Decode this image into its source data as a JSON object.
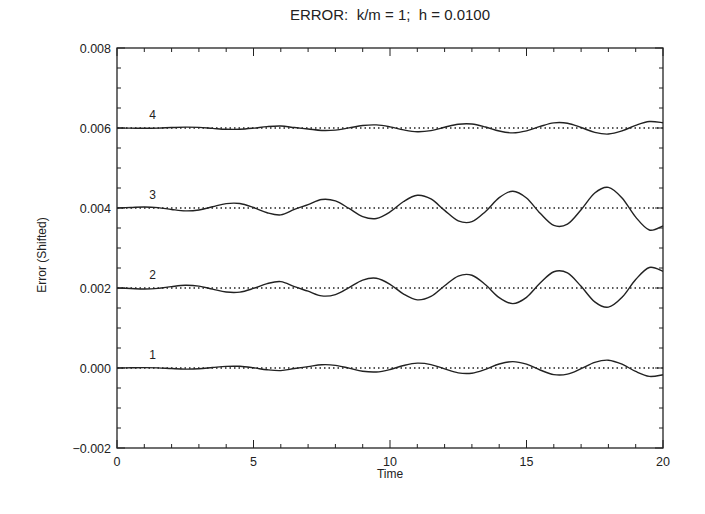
{
  "chart_data": {
    "type": "line",
    "title": "ERROR:  k/m = 1;  h = 0.0100",
    "xlabel": "Time",
    "ylabel": "Error (Shifted)",
    "xlim": [
      0,
      20
    ],
    "ylim": [
      -0.002,
      0.008
    ],
    "x_ticks": [
      0,
      5,
      10,
      15,
      20
    ],
    "x_tick_labels": [
      "0",
      "5",
      "10",
      "15",
      "20"
    ],
    "x_minor_step": 1,
    "y_ticks": [
      -0.002,
      0.0,
      0.002,
      0.004,
      0.006,
      0.008
    ],
    "y_tick_labels": [
      "-0.002",
      "0.000",
      "0.002",
      "0.004",
      "0.006",
      "0.008"
    ],
    "y_minor_step": 0.0005,
    "grid": false,
    "legend": "inline numeric labels at left of each curve",
    "x": [
      0,
      0.5,
      1,
      1.5,
      2,
      2.5,
      3,
      3.5,
      4,
      4.5,
      5,
      5.5,
      6,
      6.5,
      7,
      7.5,
      8,
      8.5,
      9,
      9.5,
      10,
      10.5,
      11,
      11.5,
      12,
      12.5,
      13,
      13.5,
      14,
      14.5,
      15,
      15.5,
      16,
      16.5,
      17,
      17.5,
      18,
      18.5,
      19,
      19.5,
      20
    ],
    "series": [
      {
        "name": "1",
        "label": "1",
        "baseline": 0.0,
        "label_x": 1.3,
        "values": [
          0.0,
          5e-06,
          1e-05,
          3e-06,
          -1.4e-05,
          -2.7e-05,
          -1.9e-05,
          1.2e-05,
          4.1e-05,
          4.2e-05,
          5e-06,
          -4.5e-05,
          -6.5e-05,
          -1.4e-05,
          3.3e-05,
          8.1e-05,
          6.7e-05,
          -4e-06,
          -8.1e-05,
          -9.9e-05,
          -3.8e-05,
          6.2e-05,
          0.000121,
          8.6e-05,
          -2.3e-05,
          -0.000122,
          -0.00013,
          -3.3e-05,
          9.9e-05,
          0.000159,
          9.5e-05,
          -5e-05,
          -0.000165,
          -0.000154,
          -1.7e-05,
          0.000141,
          0.000195,
          9.5e-05,
          -8.7e-05,
          -0.000209,
          -0.00017
        ]
      },
      {
        "name": "2",
        "label": "2",
        "baseline": 0.002,
        "label_x": 1.3,
        "values": [
          0.002,
          0.001988,
          0.001976,
          0.001991,
          0.002035,
          0.002067,
          0.002046,
          0.001971,
          0.001899,
          0.001897,
          0.001989,
          0.00211,
          0.002159,
          0.002034,
          0.00192,
          0.001802,
          0.001835,
          0.00201,
          0.002199,
          0.002244,
          0.002093,
          0.001848,
          0.001704,
          0.00179,
          0.002056,
          0.002299,
          0.002318,
          0.00208,
          0.001758,
          0.001609,
          0.001767,
          0.002124,
          0.002406,
          0.002377,
          0.002042,
          0.001653,
          0.001521,
          0.001767,
          0.002213,
          0.002513,
          0.002416
        ]
      },
      {
        "name": "3",
        "label": "3",
        "baseline": 0.004,
        "label_x": 1.3,
        "values": [
          0.004,
          0.004013,
          0.004026,
          0.004009,
          0.003963,
          0.003928,
          0.00395,
          0.004031,
          0.004109,
          0.004111,
          0.004012,
          0.003882,
          0.003829,
          0.003964,
          0.004086,
          0.004213,
          0.004177,
          0.003989,
          0.003786,
          0.003738,
          0.003901,
          0.004163,
          0.004318,
          0.004226,
          0.00394,
          0.003679,
          0.003658,
          0.003914,
          0.00426,
          0.00442,
          0.004251,
          0.003867,
          0.003564,
          0.003595,
          0.003955,
          0.004373,
          0.004515,
          0.00425,
          0.003771,
          0.003449,
          0.003553
        ]
      },
      {
        "name": "4",
        "label": "4",
        "baseline": 0.006,
        "label_x": 1.3,
        "values": [
          0.006,
          0.005996,
          0.005992,
          0.005997,
          0.006011,
          0.006021,
          0.006015,
          0.005991,
          0.005968,
          0.005968,
          0.005996,
          0.006035,
          0.00605,
          0.006011,
          0.005975,
          0.005938,
          0.005948,
          0.006003,
          0.006063,
          0.006077,
          0.006029,
          0.005952,
          0.005907,
          0.005934,
          0.006018,
          0.006094,
          0.0061,
          0.006025,
          0.005924,
          0.005877,
          0.005927,
          0.006039,
          0.006128,
          0.006119,
          0.006013,
          0.005891,
          0.005849,
          0.005927,
          0.006067,
          0.006162,
          0.006131
        ]
      }
    ],
    "colors": {
      "line": "#222222",
      "axis": "#222222",
      "baseline": "#222222",
      "background": "#ffffff"
    }
  }
}
